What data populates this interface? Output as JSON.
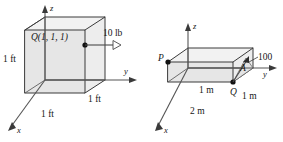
{
  "figure": {
    "colors": {
      "stroke": "#5f5f5f",
      "stroke_dark": "#3a3a3a",
      "face_top": "#f2f2f2",
      "face_front": "#e6e6e6",
      "face_side": "#ededed",
      "text": "#161616",
      "background": "#ffffff"
    },
    "left": {
      "name": "cube-force-diagram",
      "axes": {
        "z": "z",
        "y": "y",
        "x": "x"
      },
      "point_label": "Q(1, 1, 1)",
      "force_label": "10 lb",
      "dimensions": [
        {
          "id": "height",
          "text": "1 ft"
        },
        {
          "id": "depth",
          "text": "1 ft"
        },
        {
          "id": "width",
          "text": "1 ft"
        }
      ]
    },
    "right": {
      "name": "slab-force-diagram",
      "axes": {
        "z": "z",
        "y": "y",
        "x": "x"
      },
      "points": [
        {
          "id": "P",
          "text": "P"
        },
        {
          "id": "A",
          "text": "A"
        },
        {
          "id": "Q",
          "text": "Q"
        }
      ],
      "force_label": "100",
      "dimensions": [
        {
          "id": "depth",
          "text": "1 m"
        },
        {
          "id": "height",
          "text": "1 m"
        },
        {
          "id": "width",
          "text": "2 m"
        }
      ]
    }
  }
}
